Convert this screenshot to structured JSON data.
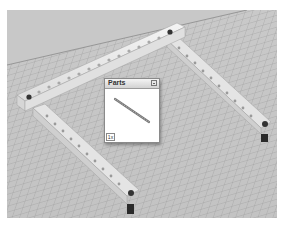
{
  "viewport": {
    "background_color": "#c6c6c6",
    "grid_color": "#8e8e8e",
    "scene": {
      "parts": [
        {
          "name": "beam-top-long",
          "color": "#e8e8e8"
        },
        {
          "name": "beam-left",
          "color": "#e8e8e8"
        },
        {
          "name": "beam-right",
          "color": "#e8e8e8"
        },
        {
          "name": "axle-pin-left",
          "color": "#2a2a2a"
        },
        {
          "name": "axle-pin-right",
          "color": "#2a2a2a"
        }
      ]
    }
  },
  "parts_window": {
    "title": "Parts",
    "count_label": "1x",
    "part_icon": "technic-beam-icon"
  }
}
